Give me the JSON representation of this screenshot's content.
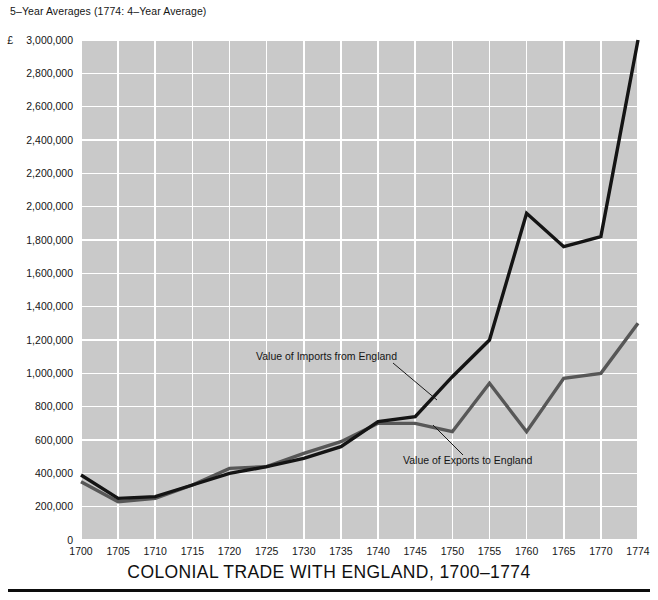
{
  "header": {
    "note": "5–Year Averages (1774: 4–Year Average)",
    "currency_symbol": "£"
  },
  "footer": {
    "title": "COLONIAL TRADE WITH ENGLAND, 1700–1774"
  },
  "colors": {
    "plot_background": "#c9c9c9",
    "gridline": "#ffffff",
    "imports_line": "#141414",
    "exports_line": "#575757",
    "text": "#151515",
    "rule": "#0d0d0d"
  },
  "annotations": [
    {
      "id": "imports-annotation",
      "text": "Value of Imports from England",
      "text_x": 256,
      "text_y": 360,
      "leader": {
        "x1": 393,
        "y1": 363,
        "x2": 437,
        "y2": 400
      }
    },
    {
      "id": "exports-annotation",
      "text": "Value of Exports to England",
      "text_x": 403,
      "text_y": 464,
      "leader": {
        "x1": 463,
        "y1": 455,
        "x2": 433,
        "y2": 425
      }
    }
  ],
  "chart_data": {
    "type": "line",
    "title": "COLONIAL TRADE WITH ENGLAND, 1700–1774",
    "subtitle": "5–Year Averages (1774: 4–Year Average)",
    "xlabel": "",
    "ylabel": "£",
    "x": [
      1700,
      1705,
      1710,
      1715,
      1720,
      1725,
      1730,
      1735,
      1740,
      1745,
      1750,
      1755,
      1760,
      1765,
      1770,
      1774
    ],
    "categories": [
      "1700",
      "1705",
      "1710",
      "1715",
      "1720",
      "1725",
      "1730",
      "1735",
      "1740",
      "1745",
      "1750",
      "1755",
      "1760",
      "1765",
      "1770",
      "1774"
    ],
    "xlim": [
      1700,
      1774
    ],
    "ylim": [
      0,
      3000000
    ],
    "ytick_values": [
      0,
      200000,
      400000,
      600000,
      800000,
      1000000,
      1200000,
      1400000,
      1600000,
      1800000,
      2000000,
      2200000,
      2400000,
      2600000,
      2800000,
      3000000
    ],
    "ytick_labels": [
      "0",
      "200,000",
      "400,000",
      "600,000",
      "800,000",
      "1,000,000",
      "1,200,000",
      "1,400,000",
      "1,600,000",
      "1,800,000",
      "2,000,000",
      "2,200,000",
      "2,400,000",
      "2,600,000",
      "2,800,000",
      "3,000,000"
    ],
    "grid": true,
    "legend_position": "inline-annotations",
    "series": [
      {
        "name": "Value of Imports from England",
        "color": "#141414",
        "width": 3.4,
        "values": [
          390000,
          250000,
          260000,
          330000,
          400000,
          440000,
          490000,
          560000,
          710000,
          740000,
          980000,
          1200000,
          1960000,
          1760000,
          1820000,
          3000000
        ]
      },
      {
        "name": "Value of Exports to England",
        "color": "#575757",
        "width": 3.4,
        "values": [
          350000,
          230000,
          250000,
          330000,
          430000,
          440000,
          520000,
          590000,
          700000,
          700000,
          650000,
          940000,
          650000,
          970000,
          1000000,
          1300000
        ]
      }
    ]
  },
  "plot_geometry": {
    "left": 81,
    "top": 40,
    "right": 638,
    "bottom": 540
  }
}
